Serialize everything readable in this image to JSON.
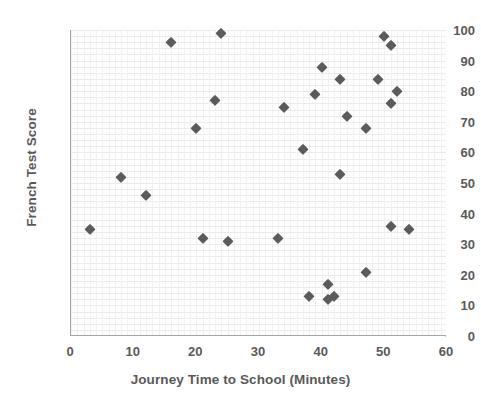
{
  "chart_data": {
    "type": "scatter",
    "title": "",
    "xlabel": "Journey Time to School (Minutes)",
    "ylabel": "French Test Score",
    "xlim": [
      0,
      60
    ],
    "ylim": [
      0,
      100
    ],
    "xticks": [
      0,
      10,
      20,
      30,
      40,
      50,
      60
    ],
    "yticks": [
      0,
      10,
      20,
      30,
      40,
      50,
      60,
      70,
      80,
      90,
      100
    ],
    "grid": true,
    "legend": null,
    "marker": {
      "shape": "diamond",
      "color": "#5b5b5b",
      "size": 7
    },
    "series": [
      {
        "name": "French Test Score vs Journey Time",
        "points": [
          {
            "x": 3,
            "y": 35
          },
          {
            "x": 8,
            "y": 52
          },
          {
            "x": 12,
            "y": 46
          },
          {
            "x": 16,
            "y": 96
          },
          {
            "x": 20,
            "y": 68
          },
          {
            "x": 21,
            "y": 32
          },
          {
            "x": 23,
            "y": 77
          },
          {
            "x": 24,
            "y": 99
          },
          {
            "x": 25,
            "y": 31
          },
          {
            "x": 33,
            "y": 32
          },
          {
            "x": 34,
            "y": 75
          },
          {
            "x": 37,
            "y": 61
          },
          {
            "x": 38,
            "y": 13
          },
          {
            "x": 40,
            "y": 88
          },
          {
            "x": 39,
            "y": 79
          },
          {
            "x": 41,
            "y": 17
          },
          {
            "x": 41,
            "y": 12
          },
          {
            "x": 42,
            "y": 13
          },
          {
            "x": 43,
            "y": 84
          },
          {
            "x": 43,
            "y": 53
          },
          {
            "x": 44,
            "y": 72
          },
          {
            "x": 47,
            "y": 68
          },
          {
            "x": 47,
            "y": 21
          },
          {
            "x": 49,
            "y": 84
          },
          {
            "x": 50,
            "y": 98
          },
          {
            "x": 51,
            "y": 95
          },
          {
            "x": 51,
            "y": 76
          },
          {
            "x": 51,
            "y": 36
          },
          {
            "x": 52,
            "y": 80
          },
          {
            "x": 54,
            "y": 35
          }
        ]
      }
    ]
  }
}
